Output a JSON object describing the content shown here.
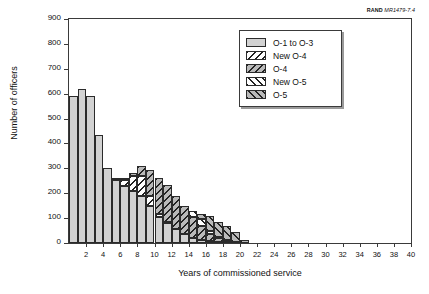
{
  "credit": {
    "org": "RAND",
    "document": "MR1479-7.4"
  },
  "chart_data": {
    "type": "bar",
    "subtype": "stacked-histogram",
    "title": "",
    "xlabel": "Years of commissioned service",
    "ylabel": "Number of officers",
    "xlim": [
      0,
      40
    ],
    "ylim": [
      0,
      900
    ],
    "ytick_step": 100,
    "xtick_step": 2,
    "grid": false,
    "legend_position": "upper-right",
    "categories": [
      1,
      2,
      3,
      4,
      5,
      6,
      7,
      8,
      9,
      10,
      11,
      12,
      13,
      14,
      15,
      16,
      17,
      18,
      19,
      20,
      21,
      22,
      23,
      24,
      25,
      26,
      27,
      28,
      29,
      30,
      31,
      32,
      33,
      34,
      35,
      36,
      37,
      38,
      39,
      40
    ],
    "xticklabels": [
      "2",
      "4",
      "6",
      "8",
      "10",
      "12",
      "14",
      "16",
      "18",
      "20",
      "22",
      "24",
      "26",
      "28",
      "30",
      "32",
      "34",
      "36",
      "38",
      "40"
    ],
    "yticklabels": [
      "0",
      "100",
      "200",
      "300",
      "400",
      "500",
      "600",
      "700",
      "800",
      "900"
    ],
    "series": [
      {
        "name": "O-1 to O-3",
        "pattern": "solid-gray",
        "color": "#d2d2d2",
        "values": [
          590,
          620,
          590,
          435,
          300,
          252,
          230,
          210,
          190,
          150,
          105,
          80,
          55,
          35,
          20,
          12,
          8,
          5,
          2,
          1,
          0,
          0,
          0,
          0,
          0,
          0,
          0,
          0,
          0,
          0,
          0,
          0,
          0,
          0,
          0,
          0,
          0,
          0,
          0,
          0
        ]
      },
      {
        "name": "New O-4",
        "pattern": "backslash-white",
        "color": "#ffffff",
        "values": [
          0,
          0,
          0,
          0,
          0,
          2,
          25,
          58,
          78,
          40,
          12,
          5,
          2,
          0,
          0,
          0,
          0,
          0,
          0,
          0,
          0,
          0,
          0,
          0,
          0,
          0,
          0,
          0,
          0,
          0,
          0,
          0,
          0,
          0,
          0,
          0,
          0,
          0,
          0,
          0
        ]
      },
      {
        "name": "O-4",
        "pattern": "backslash-gray",
        "color": "#b9b9b9",
        "values": [
          0,
          0,
          0,
          0,
          0,
          1,
          6,
          15,
          40,
          105,
          145,
          148,
          130,
          112,
          85,
          55,
          30,
          15,
          8,
          3,
          1,
          0,
          0,
          0,
          0,
          0,
          0,
          0,
          0,
          0,
          0,
          0,
          0,
          0,
          0,
          0,
          0,
          0,
          0,
          0
        ]
      },
      {
        "name": "New O-5",
        "pattern": "forwardslash-white",
        "color": "#ffffff",
        "values": [
          0,
          0,
          0,
          0,
          0,
          0,
          0,
          0,
          0,
          0,
          0,
          0,
          0,
          0,
          22,
          30,
          12,
          5,
          2,
          0,
          0,
          0,
          0,
          0,
          0,
          0,
          0,
          0,
          0,
          0,
          0,
          0,
          0,
          0,
          0,
          0,
          0,
          0,
          0,
          0
        ]
      },
      {
        "name": "O-5",
        "pattern": "forwardslash-gray",
        "color": "#b9b9b9",
        "values": [
          0,
          0,
          0,
          0,
          0,
          0,
          0,
          0,
          0,
          0,
          0,
          0,
          0,
          0,
          0,
          18,
          58,
          60,
          58,
          42,
          12,
          0,
          0,
          0,
          0,
          0,
          0,
          0,
          0,
          0,
          0,
          0,
          0,
          0,
          0,
          0,
          0,
          0,
          0,
          0
        ]
      }
    ]
  },
  "legend": {
    "items": [
      {
        "label": "O-1 to O-3",
        "pattern": "solid-gray"
      },
      {
        "label": "New O-4",
        "pattern": "backslash-white"
      },
      {
        "label": "O-4",
        "pattern": "backslash-gray"
      },
      {
        "label": "New O-5",
        "pattern": "forwardslash-white"
      },
      {
        "label": "O-5",
        "pattern": "forwardslash-gray"
      }
    ]
  }
}
